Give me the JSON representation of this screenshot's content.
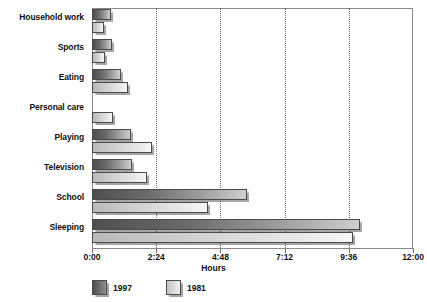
{
  "chart_data": {
    "type": "bar",
    "orientation": "horizontal",
    "title": "",
    "xlabel": "Hours",
    "ylabel": "",
    "xlim": [
      0,
      12
    ],
    "xticks": [
      "0:00",
      "2:24",
      "4:48",
      "7:12",
      "9:36",
      "12:00"
    ],
    "xtick_values": [
      0,
      2.4,
      4.8,
      7.2,
      9.6,
      12
    ],
    "grid": true,
    "grid_axis": "x",
    "legend_position": "bottom-left",
    "categories": [
      "Household work",
      "Sports",
      "Eating",
      "Personal care",
      "Playing",
      "Television",
      "School",
      "Sleeping"
    ],
    "series": [
      {
        "name": "1997",
        "color": "#6a6a6a",
        "values": [
          0.7,
          0.75,
          1.1,
          0,
          1.45,
          1.5,
          5.8,
          10.0
        ]
      },
      {
        "name": "1981",
        "color": "#dcdcdc",
        "values": [
          0.45,
          0.5,
          1.35,
          0.8,
          2.25,
          2.05,
          4.35,
          9.75
        ]
      }
    ]
  },
  "axis": {
    "x_title": "Hours"
  },
  "legend": {
    "items": [
      {
        "label": "1997",
        "swatch": "swatch-dark"
      },
      {
        "label": "1981",
        "swatch": "swatch-light"
      }
    ]
  }
}
